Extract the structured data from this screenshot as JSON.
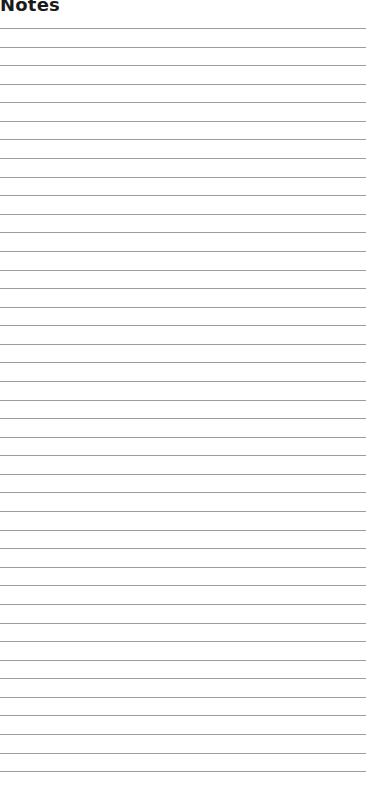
{
  "page": {
    "title": "Notes",
    "line_count": 41,
    "first_line_y": 28,
    "line_spacing": 18.58,
    "line_color": "#9c9c9c"
  }
}
